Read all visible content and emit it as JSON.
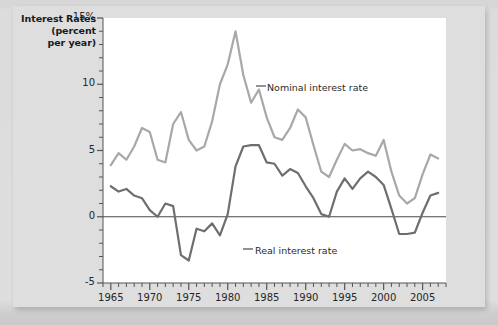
{
  "figure": {
    "axis_title_lines": [
      "Interest Rates",
      "(percent",
      "per year)"
    ],
    "background_color": "#dedede",
    "plot_background_color": "#ffffff"
  },
  "chart_data": {
    "type": "line",
    "title": "Interest Rates (percent per year)",
    "xlabel": "",
    "ylabel": "Interest Rates (percent per year)",
    "xlim": [
      1964,
      2008
    ],
    "ylim": [
      -5,
      15
    ],
    "grid": false,
    "legend_position": "inline-annotation",
    "y_tick_labels": [
      "15%",
      "10",
      "5",
      "0",
      "-5"
    ],
    "y_tick_values": [
      15,
      10,
      5,
      0,
      -5
    ],
    "y_minor_step": 1,
    "x_tick_labels": [
      "1965",
      "1970",
      "1975",
      "1980",
      "1985",
      "1990",
      "1995",
      "2000",
      "2005"
    ],
    "x_tick_values": [
      1965,
      1970,
      1975,
      1980,
      1985,
      1990,
      1995,
      2000,
      2005
    ],
    "x_minor_step": 1,
    "zero_line": 0,
    "x": [
      1965,
      1966,
      1967,
      1968,
      1969,
      1970,
      1971,
      1972,
      1973,
      1974,
      1975,
      1976,
      1977,
      1978,
      1979,
      1980,
      1981,
      1982,
      1983,
      1984,
      1985,
      1986,
      1987,
      1988,
      1989,
      1990,
      1991,
      1992,
      1993,
      1994,
      1995,
      1996,
      1997,
      1998,
      1999,
      2000,
      2001,
      2002,
      2003,
      2004,
      2005,
      2006,
      2007
    ],
    "series": [
      {
        "name": "Nominal interest rate",
        "color": "#a8a8a8",
        "label": "Nominal interest rate",
        "values": [
          3.9,
          4.8,
          4.3,
          5.3,
          6.7,
          6.4,
          4.3,
          4.1,
          7.0,
          7.9,
          5.8,
          5.0,
          5.3,
          7.2,
          10.0,
          11.5,
          14.0,
          10.7,
          8.6,
          9.6,
          7.5,
          6.0,
          5.8,
          6.7,
          8.1,
          7.5,
          5.4,
          3.4,
          3.0,
          4.3,
          5.5,
          5.0,
          5.1,
          4.8,
          4.6,
          5.8,
          3.4,
          1.6,
          1.0,
          1.4,
          3.2,
          4.7,
          4.4
        ]
      },
      {
        "name": "Real interest rate",
        "color": "#6e6e6e",
        "label": "Real interest rate",
        "values": [
          2.3,
          1.9,
          2.1,
          1.6,
          1.4,
          0.5,
          0.0,
          1.0,
          0.8,
          -2.9,
          -3.3,
          -0.9,
          -1.1,
          -0.5,
          -1.4,
          0.2,
          3.8,
          5.3,
          5.4,
          5.4,
          4.1,
          4.0,
          3.1,
          3.6,
          3.3,
          2.3,
          1.4,
          0.2,
          0.0,
          1.9,
          2.9,
          2.1,
          2.9,
          3.4,
          3.0,
          2.4,
          0.6,
          -1.3,
          -1.3,
          -1.2,
          0.3,
          1.6,
          1.8
        ]
      }
    ]
  },
  "annotations": [
    {
      "name": "nominal-annotation",
      "text": "Nominal interest rate"
    },
    {
      "name": "real-annotation",
      "text": "Real interest rate"
    }
  ]
}
